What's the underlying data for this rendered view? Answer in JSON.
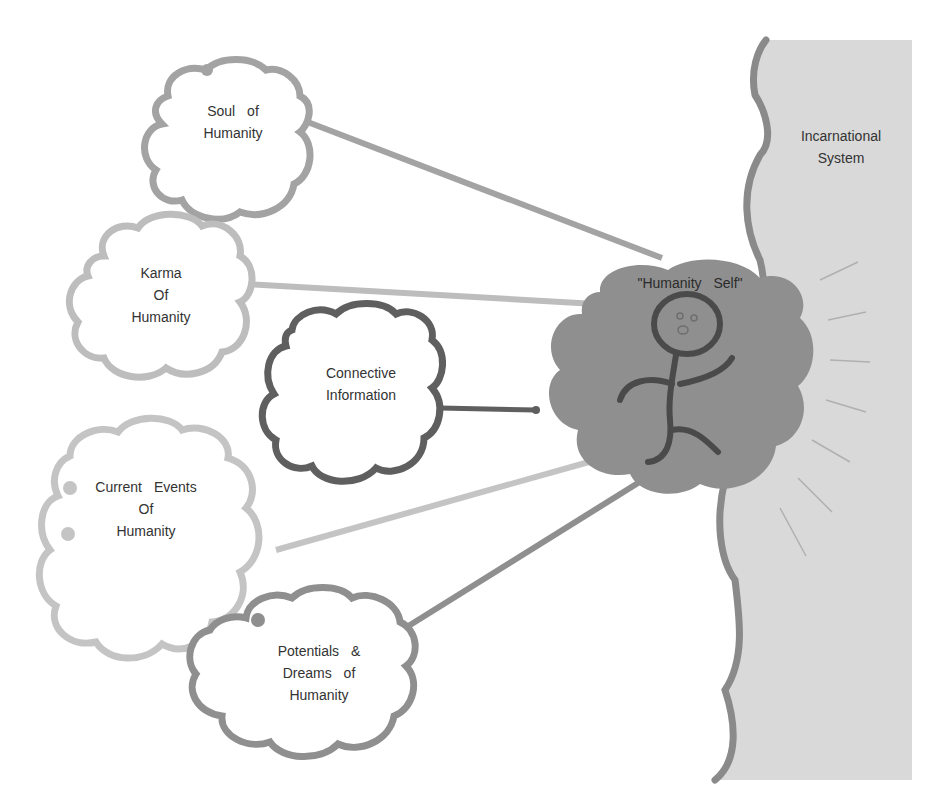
{
  "diagram": {
    "incarnational_system": {
      "label_line1": "Incarnational",
      "label_line2": "System"
    },
    "humanity_self": {
      "label": "\"Humanity Self\""
    },
    "clouds": {
      "soul": {
        "line1": "Soul of",
        "line2": "Humanity"
      },
      "karma": {
        "line1": "Karma",
        "line2": "Of",
        "line3": "Humanity"
      },
      "connective": {
        "line1": "Connective",
        "line2": "Information"
      },
      "current": {
        "line1": "Current Events",
        "line2": "Of",
        "line3": "Humanity"
      },
      "potentials": {
        "line1": "Potentials &",
        "line2": "Dreams of",
        "line3": "Humanity"
      }
    },
    "colors": {
      "system_fill": "#d9d9d9",
      "system_edge": "#8a8a8a",
      "self_cloud": "#8f8f8f",
      "soul_outline": "#a3a3a3",
      "karma_outline": "#bdbdbd",
      "connective_outline": "#5f5f5f",
      "current_outline": "#c4c4c4",
      "potentials_outline": "#8f8f8f",
      "text": "#333333"
    }
  }
}
